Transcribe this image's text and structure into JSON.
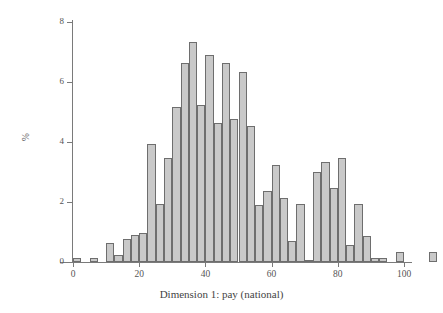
{
  "chart_data": {
    "type": "bar",
    "subtype": "histogram",
    "title": "",
    "xlabel": "Dimension 1: pay (national)",
    "ylabel": "%",
    "xlim": [
      0,
      100
    ],
    "ylim": [
      0,
      8
    ],
    "bin_width": 2.5,
    "grid": false,
    "legend": null,
    "x_ticks": [
      0,
      20,
      40,
      60,
      80,
      100
    ],
    "x_tick_labels": [
      "0",
      "20",
      "40",
      "60",
      "80",
      "100"
    ],
    "y_ticks": [
      0,
      2,
      4,
      6,
      8
    ],
    "y_tick_labels": [
      "0",
      "2",
      "4",
      "6",
      "8"
    ],
    "bar_fill": "#c9c9c9",
    "bar_stroke": "#6e6e6e",
    "axis_color": "#7a7a7a",
    "bins": [
      {
        "x0": 0.0,
        "x1": 2.5,
        "value": 0.15
      },
      {
        "x0": 2.5,
        "x1": 5.0,
        "value": 0.0
      },
      {
        "x0": 5.0,
        "x1": 7.5,
        "value": 0.12
      },
      {
        "x0": 7.5,
        "x1": 10.0,
        "value": 0.0
      },
      {
        "x0": 10.0,
        "x1": 12.5,
        "value": 0.62
      },
      {
        "x0": 12.5,
        "x1": 15.0,
        "value": 0.22
      },
      {
        "x0": 15.0,
        "x1": 17.5,
        "value": 0.78
      },
      {
        "x0": 17.5,
        "x1": 20.0,
        "value": 0.9
      },
      {
        "x0": 20.0,
        "x1": 22.5,
        "value": 0.98
      },
      {
        "x0": 22.5,
        "x1": 25.0,
        "value": 3.95
      },
      {
        "x0": 25.0,
        "x1": 27.5,
        "value": 1.95
      },
      {
        "x0": 27.5,
        "x1": 30.0,
        "value": 3.47
      },
      {
        "x0": 30.0,
        "x1": 32.5,
        "value": 5.18
      },
      {
        "x0": 32.5,
        "x1": 35.0,
        "value": 6.63
      },
      {
        "x0": 35.0,
        "x1": 37.5,
        "value": 7.32
      },
      {
        "x0": 37.5,
        "x1": 40.0,
        "value": 5.22
      },
      {
        "x0": 40.0,
        "x1": 42.5,
        "value": 6.9
      },
      {
        "x0": 42.5,
        "x1": 45.0,
        "value": 4.62
      },
      {
        "x0": 45.0,
        "x1": 47.5,
        "value": 6.62
      },
      {
        "x0": 47.5,
        "x1": 50.0,
        "value": 4.78
      },
      {
        "x0": 50.0,
        "x1": 52.5,
        "value": 6.35
      },
      {
        "x0": 52.5,
        "x1": 55.0,
        "value": 4.55
      },
      {
        "x0": 55.0,
        "x1": 57.5,
        "value": 1.9
      },
      {
        "x0": 57.5,
        "x1": 60.0,
        "value": 2.37
      },
      {
        "x0": 60.0,
        "x1": 62.5,
        "value": 3.25
      },
      {
        "x0": 62.5,
        "x1": 65.0,
        "value": 2.13
      },
      {
        "x0": 65.0,
        "x1": 67.5,
        "value": 0.7
      },
      {
        "x0": 67.5,
        "x1": 70.0,
        "value": 1.92
      },
      {
        "x0": 70.0,
        "x1": 72.5,
        "value": 0.07
      },
      {
        "x0": 72.5,
        "x1": 75.0,
        "value": 3.0
      },
      {
        "x0": 75.0,
        "x1": 77.5,
        "value": 3.33
      },
      {
        "x0": 77.5,
        "x1": 80.0,
        "value": 2.47
      },
      {
        "x0": 80.0,
        "x1": 82.5,
        "value": 3.47
      },
      {
        "x0": 82.5,
        "x1": 85.0,
        "value": 0.57
      },
      {
        "x0": 85.0,
        "x1": 87.5,
        "value": 1.92
      },
      {
        "x0": 87.5,
        "x1": 90.0,
        "value": 0.88
      },
      {
        "x0": 90.0,
        "x1": 92.5,
        "value": 0.13
      },
      {
        "x0": 92.5,
        "x1": 95.0,
        "value": 0.13
      },
      {
        "x0": 95.0,
        "x1": 97.5,
        "value": 0.0
      },
      {
        "x0": 97.5,
        "x1": 100.0,
        "value": 0.35
      },
      {
        "x0": 100.0,
        "x1": 102.5,
        "value": 0.0
      },
      {
        "x0": 102.5,
        "x1": 105.0,
        "value": 0.0
      },
      {
        "x0": 105.0,
        "x1": 107.5,
        "value": 0.0
      },
      {
        "x0": 107.5,
        "x1": 110.0,
        "value": 0.35
      }
    ]
  }
}
